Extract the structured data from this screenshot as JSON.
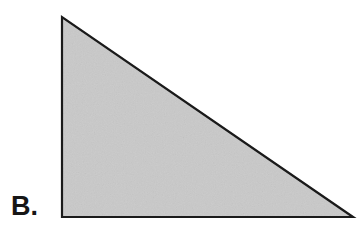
{
  "figure": {
    "label": "B.",
    "shape_name": "right-triangle",
    "fill_color": "#c9c9c9",
    "stroke_color": "#1a1a1a",
    "stroke_width": 2,
    "background_color": "#ffffff",
    "vertices": [
      {
        "name": "apex-top-left",
        "x": 62,
        "y": 17
      },
      {
        "name": "right-angle-bottom-left",
        "x": 62,
        "y": 217
      },
      {
        "name": "bottom-right",
        "x": 353,
        "y": 217
      }
    ],
    "points_attr": "62,17 62,217 353,217",
    "edges": [
      {
        "name": "vertical-leg",
        "length_px": 200
      },
      {
        "name": "horizontal-leg",
        "length_px": 291
      },
      {
        "name": "hypotenuse",
        "length_px": 353
      }
    ],
    "right_angle_at": "bottom-left"
  }
}
